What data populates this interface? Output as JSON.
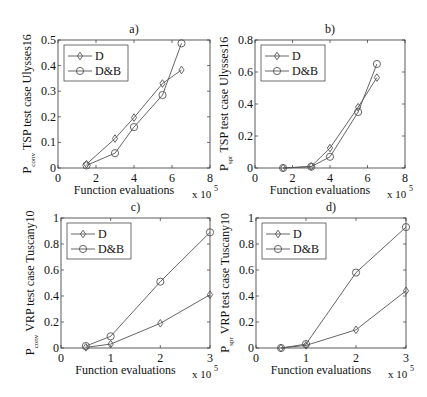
{
  "chart_data": [
    {
      "id": "a",
      "type": "line",
      "title": "a)",
      "xlabel": "Function evaluations",
      "x_multiplier": "x 10",
      "x_exponent": "5",
      "ylabel_main": "P",
      "ylabel_sub": "conv",
      "ylabel_rest": "TSP test case Ulysses16",
      "xlim": [
        0,
        8
      ],
      "ylim": [
        0,
        0.5
      ],
      "xticks": [
        0,
        2,
        4,
        6,
        8
      ],
      "yticks": [
        0,
        0.1,
        0.2,
        0.3,
        0.4,
        0.5
      ],
      "ytick_labels": [
        "0",
        "0.1",
        "0.2",
        "0.3",
        "0.4",
        "0.5"
      ],
      "grid": false,
      "legend_position": "upper left",
      "frame": {
        "x": 58,
        "y": 40,
        "w": 152,
        "h": 128
      },
      "series": [
        {
          "name": "D",
          "marker": "diamond",
          "x": [
            1.5,
            3,
            4,
            5.5,
            6.5
          ],
          "values": [
            0.015,
            0.115,
            0.197,
            0.33,
            0.383
          ]
        },
        {
          "name": "D&B",
          "marker": "circle",
          "x": [
            1.5,
            3,
            4,
            5.5,
            6.5
          ],
          "values": [
            0.01,
            0.058,
            0.16,
            0.285,
            0.487
          ]
        }
      ]
    },
    {
      "id": "b",
      "type": "line",
      "title": "b)",
      "xlabel": "Function evaluations",
      "x_multiplier": "x 10",
      "x_exponent": "5",
      "ylabel_main": "P",
      "ylabel_sub": "spr",
      "ylabel_rest": "TSP test case Ulysses16",
      "xlim": [
        0,
        8
      ],
      "ylim": [
        0,
        0.8
      ],
      "xticks": [
        0,
        2,
        4,
        6,
        8
      ],
      "yticks": [
        0,
        0.2,
        0.4,
        0.6,
        0.8
      ],
      "ytick_labels": [
        "0",
        "0.2",
        "0.4",
        "0.6",
        "0.8"
      ],
      "grid": false,
      "legend_position": "upper left",
      "frame": {
        "x": 255,
        "y": 40,
        "w": 150,
        "h": 128
      },
      "series": [
        {
          "name": "D",
          "marker": "diamond",
          "x": [
            1.5,
            3,
            4,
            5.5,
            6.5
          ],
          "values": [
            0.0,
            0.01,
            0.125,
            0.38,
            0.565
          ]
        },
        {
          "name": "D&B",
          "marker": "circle",
          "x": [
            1.5,
            3,
            4,
            5.5,
            6.5
          ],
          "values": [
            0.0,
            0.008,
            0.07,
            0.35,
            0.65
          ]
        }
      ]
    },
    {
      "id": "c",
      "type": "line",
      "title": "c)",
      "xlabel": "Function evaluations",
      "x_multiplier": "x 10",
      "x_exponent": "5",
      "ylabel_main": "P",
      "ylabel_sub": "conv",
      "ylabel_rest": "VRP test case Tuscany10",
      "xlim": [
        0,
        3
      ],
      "ylim": [
        0,
        1
      ],
      "xticks": [
        0,
        1,
        2,
        3
      ],
      "yticks": [
        0,
        0.2,
        0.4,
        0.6,
        0.8,
        1
      ],
      "ytick_labels": [
        "0",
        "0.2",
        "0.4",
        "0.6",
        "0.8",
        "1"
      ],
      "grid": false,
      "legend_position": "upper left",
      "frame": {
        "x": 61,
        "y": 218,
        "w": 149,
        "h": 130
      },
      "series": [
        {
          "name": "D",
          "marker": "diamond",
          "x": [
            0.5,
            1,
            2,
            3
          ],
          "values": [
            0.005,
            0.03,
            0.19,
            0.41
          ]
        },
        {
          "name": "D&B",
          "marker": "circle",
          "x": [
            0.5,
            1,
            2,
            3
          ],
          "values": [
            0.015,
            0.09,
            0.51,
            0.89
          ]
        }
      ]
    },
    {
      "id": "d",
      "type": "line",
      "title": "d)",
      "xlabel": "Function evaluations",
      "x_multiplier": "x 10",
      "x_exponent": "5",
      "ylabel_main": "P",
      "ylabel_sub": "spr",
      "ylabel_rest": "VRP test case Tuscany10",
      "xlim": [
        0,
        3
      ],
      "ylim": [
        0,
        1
      ],
      "xticks": [
        0,
        1,
        2,
        3
      ],
      "yticks": [
        0,
        0.2,
        0.4,
        0.6,
        0.8,
        1
      ],
      "ytick_labels": [
        "0",
        "0.2",
        "0.4",
        "0.6",
        "0.8",
        "1"
      ],
      "grid": false,
      "legend_position": "upper left",
      "frame": {
        "x": 256,
        "y": 218,
        "w": 150,
        "h": 130
      },
      "series": [
        {
          "name": "D",
          "marker": "diamond",
          "x": [
            0.5,
            1,
            2,
            3
          ],
          "values": [
            0.0,
            0.02,
            0.14,
            0.44
          ]
        },
        {
          "name": "D&B",
          "marker": "circle",
          "x": [
            0.5,
            1,
            2,
            3
          ],
          "values": [
            0.0,
            0.03,
            0.58,
            0.93
          ]
        }
      ]
    }
  ],
  "style": {
    "line_color": "#555555",
    "axis_color": "#333333",
    "text_color": "#111111"
  }
}
